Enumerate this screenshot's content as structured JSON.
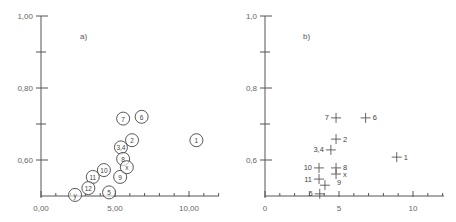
{
  "figure": {
    "background": "#ffffff",
    "ink_color": "#555555"
  },
  "chart_data": [
    {
      "type": "scatter",
      "panel_label": "a)",
      "title": "",
      "xlabel": "",
      "ylabel": "",
      "marker": "labeled-circle",
      "xlim": [
        0,
        12
      ],
      "ylim": [
        0.5,
        1.0
      ],
      "x_ticks_major": [
        0,
        5,
        10
      ],
      "x_tick_labels": [
        "0,00",
        "5,00",
        "10,00"
      ],
      "x_ticks_minor_step": 1,
      "y_ticks_major": [
        0.6,
        0.8,
        1.0
      ],
      "y_tick_labels": [
        "0,60",
        "0,80",
        "1,00"
      ],
      "y_ticks_minor": [
        0.7,
        0.9
      ],
      "grid": false,
      "points": [
        {
          "label": "1",
          "x": 10.5,
          "y": 0.655
        },
        {
          "label": "2",
          "x": 6.15,
          "y": 0.655
        },
        {
          "label": "3,4",
          "x": 5.4,
          "y": 0.635
        },
        {
          "label": "5",
          "x": 4.6,
          "y": 0.51
        },
        {
          "label": "6",
          "x": 6.8,
          "y": 0.72
        },
        {
          "label": "7",
          "x": 5.55,
          "y": 0.715
        },
        {
          "label": "8",
          "x": 5.55,
          "y": 0.603
        },
        {
          "label": "9",
          "x": 5.35,
          "y": 0.553
        },
        {
          "label": "10",
          "x": 4.25,
          "y": 0.572
        },
        {
          "label": "11",
          "x": 3.5,
          "y": 0.553
        },
        {
          "label": "12",
          "x": 3.2,
          "y": 0.522
        },
        {
          "label": "x",
          "x": 5.8,
          "y": 0.58
        },
        {
          "label": "y",
          "x": 2.3,
          "y": 0.503
        }
      ]
    },
    {
      "type": "scatter",
      "panel_label": "b)",
      "title": "",
      "xlabel": "",
      "ylabel": "",
      "marker": "cross-with-label",
      "xlim": [
        0,
        12
      ],
      "ylim": [
        0.5,
        1.0
      ],
      "x_ticks_major": [
        0,
        5,
        10
      ],
      "x_tick_labels": [
        "0",
        "5",
        "10"
      ],
      "x_ticks_minor_step": 1,
      "y_ticks_major": [
        0.6,
        0.8,
        1.0
      ],
      "y_tick_labels": [
        "0,6",
        "0,8",
        "1,0"
      ],
      "y_ticks_minor": [
        0.7,
        0.9
      ],
      "grid": false,
      "points": [
        {
          "label": "1",
          "x": 8.9,
          "y": 0.608,
          "label_side": "right"
        },
        {
          "label": "2",
          "x": 4.8,
          "y": 0.658,
          "label_side": "right"
        },
        {
          "label": "3,4",
          "x": 4.45,
          "y": 0.628,
          "label_side": "left"
        },
        {
          "label": "5",
          "x": 3.7,
          "y": 0.506,
          "label_side": "left"
        },
        {
          "label": "6",
          "x": 6.8,
          "y": 0.717,
          "label_side": "right"
        },
        {
          "label": "7",
          "x": 4.8,
          "y": 0.717,
          "label_side": "left"
        },
        {
          "label": "8",
          "x": 4.8,
          "y": 0.578,
          "label_side": "right"
        },
        {
          "label": "9",
          "x": 4.05,
          "y": 0.53,
          "label_side": "right-far"
        },
        {
          "label": "10",
          "x": 3.65,
          "y": 0.578,
          "label_side": "left"
        },
        {
          "label": "11",
          "x": 3.65,
          "y": 0.547,
          "label_side": "left"
        },
        {
          "label": "x",
          "x": 4.8,
          "y": 0.561,
          "label_side": "right"
        }
      ]
    }
  ]
}
